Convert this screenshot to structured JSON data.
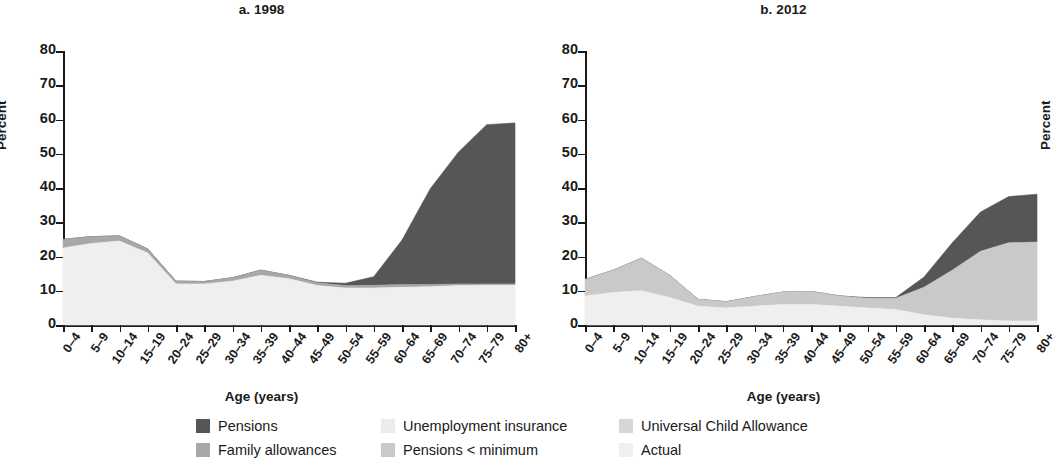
{
  "figure": {
    "panels": [
      {
        "id": "a",
        "title": "a. 1998"
      },
      {
        "id": "b",
        "title": "b. 2012"
      }
    ],
    "axis_title_y": "Percent",
    "axis_title_x": "Age (years)"
  },
  "legend": {
    "items": [
      {
        "label": "Pensions",
        "color": "#565656"
      },
      {
        "label": "Unemployment insurance",
        "color": "#ececec"
      },
      {
        "label": "Universal Child Allowance",
        "color": "#d6d6d6"
      },
      {
        "label": "Family allowances",
        "color": "#a8a8a8"
      },
      {
        "label": "Pensions < minimum",
        "color": "#c9c9c9"
      },
      {
        "label": "Actual",
        "color": "#efefef"
      }
    ]
  },
  "chart_data": [
    {
      "type": "area",
      "panel": "a",
      "title": "a. 1998",
      "xlabel": "Age (years)",
      "ylabel": "Percent",
      "ylim": [
        0,
        80
      ],
      "yticks": [
        0,
        10,
        20,
        30,
        40,
        50,
        60,
        70,
        80
      ],
      "grid": false,
      "legend_position": "bottom",
      "categories": [
        "0–4",
        "5–9",
        "10–14",
        "15–19",
        "20–24",
        "25–29",
        "30–34",
        "35–39",
        "40–44",
        "45–49",
        "50–54",
        "55–59",
        "60–64",
        "65–69",
        "70–74",
        "75–79",
        "80+"
      ],
      "stacking": "stacked",
      "series": [
        {
          "name": "Actual",
          "color": "#efefef",
          "values": [
            22.5,
            23.8,
            24.5,
            21.0,
            12.0,
            12.0,
            12.8,
            14.5,
            13.5,
            11.5,
            10.8,
            10.8,
            11.0,
            11.2,
            11.5,
            11.6,
            11.6
          ]
        },
        {
          "name": "Family allowances",
          "color": "#a8a8a8",
          "values": [
            2.5,
            2.0,
            1.5,
            1.2,
            0.8,
            0.7,
            1.0,
            1.5,
            1.0,
            0.8,
            0.7,
            0.8,
            0.8,
            0.6,
            0.5,
            0.4,
            0.4
          ]
        },
        {
          "name": "Pensions",
          "color": "#565656",
          "values": [
            0.0,
            0.0,
            0.0,
            0.0,
            0.0,
            0.0,
            0.0,
            0.0,
            0.0,
            0.2,
            0.7,
            2.5,
            13.0,
            28.0,
            38.5,
            46.5,
            47.0
          ]
        }
      ],
      "totals": [
        25.0,
        25.8,
        26.0,
        22.2,
        12.8,
        12.7,
        13.8,
        16.0,
        14.5,
        12.5,
        12.2,
        14.1,
        24.8,
        39.8,
        50.5,
        58.5,
        59.0
      ]
    },
    {
      "type": "area",
      "panel": "b",
      "title": "b. 2012",
      "xlabel": "Age (years)",
      "ylabel": "Percent",
      "ylim": [
        0,
        80
      ],
      "yticks": [
        0,
        10,
        20,
        30,
        40,
        50,
        60,
        70,
        80
      ],
      "grid": false,
      "legend_position": "bottom",
      "categories": [
        "0–4",
        "5–9",
        "10–14",
        "15–19",
        "20–24",
        "25–29",
        "30–34",
        "35–39",
        "40–44",
        "45–49",
        "50–54",
        "55–59",
        "60–64",
        "65–69",
        "70–74",
        "75–79",
        "80+"
      ],
      "stacking": "stacked",
      "series": [
        {
          "name": "Actual",
          "color": "#efefef",
          "values": [
            8.5,
            9.5,
            10.0,
            8.0,
            5.5,
            5.0,
            5.5,
            6.0,
            6.0,
            5.5,
            5.0,
            4.5,
            3.0,
            2.0,
            1.5,
            1.2,
            1.2
          ]
        },
        {
          "name": "Universal Child Allowance",
          "color": "#c9c9c9",
          "values": [
            4.8,
            6.5,
            9.5,
            6.5,
            2.0,
            1.8,
            2.8,
            3.6,
            3.8,
            3.0,
            2.8,
            3.3,
            8.0,
            14.0,
            20.0,
            22.8,
            23.0
          ]
        },
        {
          "name": "Pensions",
          "color": "#565656",
          "values": [
            0.0,
            0.0,
            0.0,
            0.0,
            0.0,
            0.0,
            0.0,
            0.0,
            0.0,
            0.0,
            0.2,
            0.2,
            3.0,
            8.0,
            11.5,
            13.5,
            14.0
          ]
        }
      ],
      "totals": [
        13.3,
        16.0,
        19.5,
        14.5,
        7.5,
        6.8,
        8.3,
        9.6,
        9.8,
        8.5,
        8.0,
        8.0,
        14.0,
        24.0,
        33.0,
        37.5,
        38.2
      ]
    }
  ]
}
